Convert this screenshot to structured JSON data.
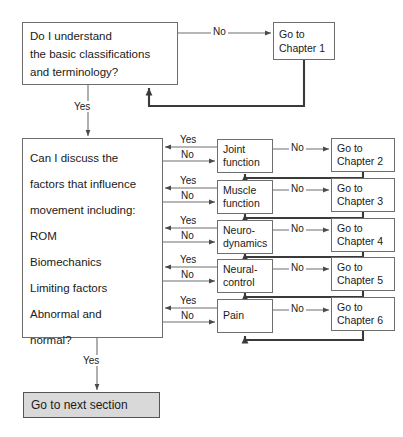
{
  "diagram": {
    "colors": {
      "stroke": "#6e6e6e",
      "thick_stroke": "#444444",
      "fill_highlight": "#d9d9d9",
      "background": "#ffffff",
      "text": "#1a1a1a"
    },
    "nodes": {
      "understand": {
        "lines": [
          "Do I understand",
          "the basic classifications",
          "and terminology?"
        ]
      },
      "chapter1": {
        "lines": [
          "Go to",
          "Chapter 1"
        ]
      },
      "discuss": {
        "lines": [
          "Can I discuss the",
          "factors that influence",
          "movement including:",
          "ROM",
          "Biomechanics",
          "Limiting factors",
          "Abnormal and",
          "normal?"
        ]
      },
      "next_section": {
        "label": "Go to next section"
      }
    },
    "rows": [
      {
        "topic_lines": [
          "Joint",
          "function"
        ],
        "chapter_lines": [
          "Go to",
          "Chapter 2"
        ],
        "yes_label": "Yes",
        "no_label": "No"
      },
      {
        "topic_lines": [
          "Muscle",
          "function"
        ],
        "chapter_lines": [
          "Go to",
          "Chapter 3"
        ],
        "yes_label": "Yes",
        "no_label": "No"
      },
      {
        "topic_lines": [
          "Neuro-",
          "dynamics"
        ],
        "chapter_lines": [
          "Go to",
          "Chapter 4"
        ],
        "yes_label": "Yes",
        "no_label": "No"
      },
      {
        "topic_lines": [
          "Neural-",
          "control"
        ],
        "chapter_lines": [
          "Go to",
          "Chapter 5"
        ],
        "yes_label": "Yes",
        "no_label": "No"
      },
      {
        "topic_lines": [
          "Pain"
        ],
        "chapter_lines": [
          "Go to",
          "Chapter 6"
        ],
        "yes_label": "Yes",
        "no_label": "No"
      }
    ],
    "edges": {
      "understand_no": "No",
      "understand_yes": "Yes",
      "discuss_yes": "Yes"
    }
  }
}
